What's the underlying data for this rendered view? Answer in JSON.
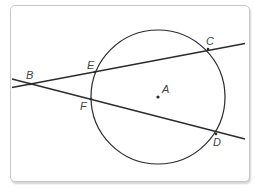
{
  "diagram": {
    "colors": {
      "stroke": "#2b2b2b",
      "label": "#444444",
      "frame_border": "#c8c8c8"
    },
    "circle": {
      "center_label": "A",
      "cx": 158,
      "cy": 97,
      "r": 67
    },
    "points": {
      "A": {
        "label": "A",
        "x": 158,
        "y": 97
      },
      "B": {
        "label": "B",
        "x": 30,
        "y": 84
      },
      "C": {
        "label": "C",
        "x": 208,
        "y": 49
      },
      "D": {
        "label": "D",
        "x": 216,
        "y": 134
      },
      "E": {
        "label": "E",
        "x": 95,
        "y": 72
      },
      "F": {
        "label": "F",
        "x": 91,
        "y": 99
      }
    },
    "lines": [
      {
        "name": "secant-BEC",
        "through": [
          "B",
          "E",
          "C"
        ]
      },
      {
        "name": "secant-BFD",
        "through": [
          "B",
          "F",
          "D"
        ]
      }
    ]
  }
}
